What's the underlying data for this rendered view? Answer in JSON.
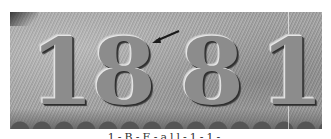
{
  "image": {
    "subject": "coin date close-up",
    "style": "grayscale photograph",
    "date_digits": [
      "1",
      "8",
      "8",
      "1"
    ],
    "annotation": {
      "type": "arrow",
      "points_to": "top of first 8"
    },
    "caption": "1-B-E-all-1-1-"
  },
  "colors": {
    "background": "#ffffff",
    "coin_field": "#a0a0a0",
    "arrow": "#1a1a1a"
  }
}
